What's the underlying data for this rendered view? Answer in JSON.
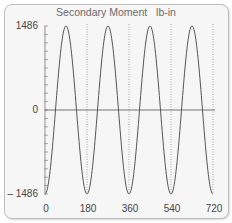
{
  "chart_data": {
    "type": "line",
    "title": "Secondary Moment",
    "units": "lb-in",
    "xlabel": "",
    "ylabel": "",
    "x_ticks": [
      0,
      180,
      360,
      540,
      720
    ],
    "y_ticks": [
      1486,
      0,
      -1486
    ],
    "y_tick_labels": [
      "1486",
      "0",
      "– 1486"
    ],
    "xlim": [
      0,
      720
    ],
    "ylim": [
      -1486,
      1486
    ],
    "grid": "vertical dotted at 180, 360, 540, 720",
    "legend": null,
    "series": [
      {
        "name": "Secondary Moment",
        "formula": "-1486*cos(2*theta)",
        "x": [
          0,
          45,
          90,
          135,
          180,
          225,
          270,
          315,
          360,
          405,
          450,
          495,
          540,
          585,
          630,
          675,
          720
        ],
        "values": [
          -1486,
          0,
          1486,
          0,
          -1486,
          0,
          1486,
          0,
          -1486,
          0,
          1486,
          0,
          -1486,
          0,
          1486,
          0,
          -1486
        ]
      }
    ]
  },
  "labels": {
    "title": "Secondary Moment",
    "units": "lb-in",
    "y_top": "1486",
    "y_zero": "0",
    "y_bottom": "– 1486",
    "x0": "0",
    "x1": "180",
    "x2": "360",
    "x3": "540",
    "x4": "720"
  }
}
